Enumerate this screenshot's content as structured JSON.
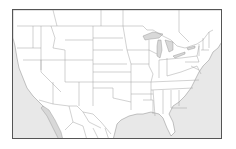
{
  "map": {
    "type": "blank outline map",
    "region": "Contiguous United States with parts of Canada and Mexico",
    "colors": {
      "land": "#ffffff",
      "water": "#e8e8e8",
      "borders": "#8a8a8a",
      "frame": "#555555"
    },
    "labels": []
  }
}
